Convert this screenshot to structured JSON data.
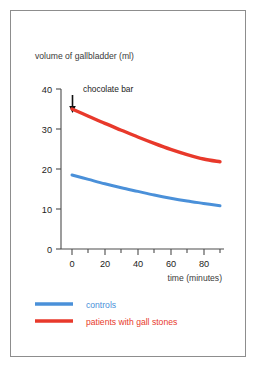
{
  "figure": {
    "border_color": "#8d8d8d",
    "background": "#ffffff"
  },
  "chart_data": {
    "type": "line",
    "title": "volume of gallbladder (ml)",
    "xlabel": "time (minutes)",
    "ylabel": "",
    "xlim": [
      0,
      90
    ],
    "ylim": [
      0,
      42
    ],
    "grid": false,
    "legend_position": "bottom-left",
    "x_ticks": [
      0,
      20,
      40,
      60,
      80
    ],
    "x_tick_labels": [
      "0",
      "20",
      "40",
      "60",
      "80"
    ],
    "x_minor_ticks": [
      10,
      30,
      50,
      70,
      90
    ],
    "y_ticks": [
      0,
      10,
      20,
      30,
      40
    ],
    "y_tick_labels": [
      "0",
      "10",
      "20",
      "30",
      "40"
    ],
    "x": [
      0,
      10,
      20,
      30,
      40,
      50,
      60,
      70,
      80,
      90
    ],
    "series": [
      {
        "name": "patients with gall stones",
        "color": "#e8392b",
        "values": [
          35.0,
          33.2,
          31.4,
          29.7,
          28.0,
          26.4,
          24.9,
          23.6,
          22.5,
          21.8
        ]
      },
      {
        "name": "controls",
        "color": "#4a90d9",
        "values": [
          18.5,
          17.4,
          16.3,
          15.3,
          14.4,
          13.5,
          12.7,
          12.0,
          11.4,
          10.8
        ]
      }
    ],
    "annotations": [
      {
        "text": "chocolate bar",
        "x": 0,
        "y": 40,
        "arrow": "down-arrow"
      }
    ]
  },
  "legend": {
    "items": [
      {
        "label": "controls",
        "color": "#4a90d9"
      },
      {
        "label": "patients with gall stones",
        "color": "#e8392b"
      }
    ]
  }
}
